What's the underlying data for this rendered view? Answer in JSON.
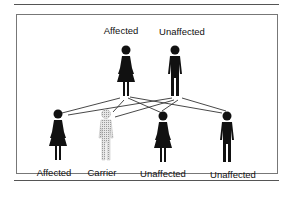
{
  "diagram": {
    "parents": [
      {
        "label": "Affected",
        "sex": "female",
        "status": "affected"
      },
      {
        "label": "Unaffected",
        "sex": "male",
        "status": "unaffected"
      }
    ],
    "children": [
      {
        "label": "Affected",
        "sex": "female",
        "status": "affected"
      },
      {
        "label": "Carrier",
        "sex": "male",
        "status": "carrier"
      },
      {
        "label": "Unaffected",
        "sex": "female",
        "status": "unaffected"
      },
      {
        "label": "Unaffected",
        "sex": "male",
        "status": "unaffected"
      }
    ],
    "colors": {
      "figure": "#111111",
      "carrier": "#c8c8c8",
      "line": "#333333"
    }
  }
}
